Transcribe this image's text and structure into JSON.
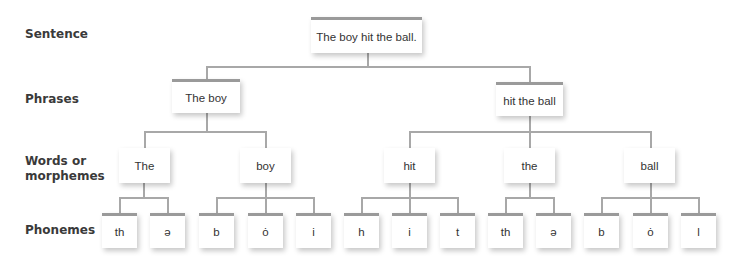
{
  "levels": {
    "sentence": "Sentence",
    "phrases": "Phrases",
    "words_line1": "Words or",
    "words_line2": "morphemes",
    "phonemes": "Phonemes"
  },
  "sentence": "The boy hit the ball.",
  "phrases": [
    "The boy",
    "hit the ball"
  ],
  "words": [
    "The",
    "boy",
    "hit",
    "the",
    "ball"
  ],
  "phonemes": [
    "th",
    "ə",
    "b",
    "ȯ",
    "i",
    "h",
    "i",
    "t",
    "th",
    "ə",
    "b",
    "ȯ",
    "l"
  ],
  "colors": {
    "line": "#a8a8a8",
    "box_top_bar": "#9a9a9a",
    "label_text": "#3a3a3a"
  }
}
